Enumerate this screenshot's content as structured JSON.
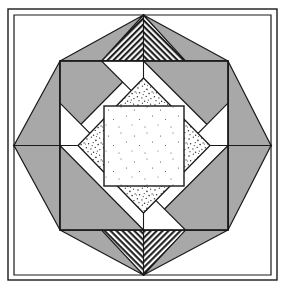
{
  "figure": {
    "kind": "geometric-quilt-block-diagram",
    "caption": "",
    "canvas": {
      "width": 288,
      "height": 293
    }
  },
  "colors": {
    "background": "#ffffff",
    "outline": "#1a1a1a",
    "solid_gray": "#a8a8a8",
    "hatch_line": "#222222",
    "hatch_background": "#ffffff",
    "stipple_dot": "#3a3a3a",
    "stipple_background": "#ffffff",
    "white_fill": "#ffffff"
  },
  "frame": {
    "name": "outer-border",
    "x": 8,
    "y": 9,
    "width": 269,
    "height": 271,
    "stroke_width": 1.4,
    "fill": "#ffffff"
  },
  "geometry": {
    "center": {
      "x": 143.5,
      "y": 145.5
    },
    "outer_square": {
      "left": 14,
      "top": 15,
      "right": 271,
      "bottom": 275
    },
    "hatched_ring_outer_diamond": [
      {
        "x": 143.5,
        "y": 15
      },
      {
        "x": 271,
        "y": 145.5
      },
      {
        "x": 143.5,
        "y": 275
      },
      {
        "x": 14,
        "y": 145.5
      }
    ],
    "hatched_ring_inner_diamond": [
      {
        "x": 143.5,
        "y": 60
      },
      {
        "x": 228,
        "y": 145.5
      },
      {
        "x": 143.5,
        "y": 231
      },
      {
        "x": 60,
        "y": 145.5
      }
    ],
    "middle_white_square": {
      "left": 60,
      "top": 61,
      "right": 228,
      "bottom": 230
    },
    "stipple_diamond": [
      {
        "x": 143.5,
        "y": 78
      },
      {
        "x": 210,
        "y": 145.5
      },
      {
        "x": 143.5,
        "y": 213
      },
      {
        "x": 78,
        "y": 145.5
      }
    ],
    "center_white_square": {
      "left": 104,
      "top": 106,
      "right": 184,
      "bottom": 186
    }
  },
  "shapes": {
    "outer_corner_triangles": [
      {
        "name": "corner-triangle-top-left",
        "points": "14,15 143.5,15 14,145.5",
        "fill": "white"
      },
      {
        "name": "corner-triangle-top-right",
        "points": "143.5,15 271,15 271,145.5",
        "fill": "white"
      },
      {
        "name": "corner-triangle-bottom-left",
        "points": "14,145.5 14,275 143.5,275",
        "fill": "white"
      },
      {
        "name": "corner-triangle-bottom-right",
        "points": "271,145.5 271,275 143.5,275",
        "fill": "white"
      }
    ],
    "hatched_band_segments": [
      {
        "name": "hatch-band-top-left",
        "points": "143.5,15 143.5,60 60,145.5 14,145.5"
      },
      {
        "name": "hatch-band-top-right",
        "points": "143.5,15 271,145.5 228,145.5 143.5,60"
      },
      {
        "name": "hatch-band-bottom-right",
        "points": "271,145.5 143.5,275 143.5,231 228,145.5"
      },
      {
        "name": "hatch-band-bottom-left",
        "points": "14,145.5 60,145.5 143.5,231 143.5,275"
      }
    ],
    "gray_outer_corner_triangles": [
      {
        "name": "gray-triangle-outer-top-left",
        "points": "60,61 143.5,61 102,103"
      },
      {
        "name": "gray-triangle-outer-top-right",
        "points": "143.5,61 228,61 186,103"
      },
      {
        "name": "gray-triangle-outer-bottom-left",
        "points": "60,230 143.5,230 102,188"
      },
      {
        "name": "gray-triangle-outer-bottom-right",
        "points": "143.5,230 228,230 186,188"
      }
    ],
    "gray_flag_triangles": [
      {
        "name": "gray-flag-top-left",
        "points": "60,61 60,145.5 143.5,61"
      },
      {
        "name": "gray-flag-top-right",
        "points": "228,61 228,145.5 143.5,61"
      },
      {
        "name": "gray-flag-bottom-left",
        "points": "60,230 60,145.5 143.5,230"
      },
      {
        "name": "gray-flag-bottom-right",
        "points": "228,230 228,145.5 143.5,230"
      }
    ],
    "gray_notch_squares": [
      {
        "name": "gray-notch-top-left",
        "points": "60,61 143.5,61 143.5,78 78,145.5 60,145.5"
      },
      {
        "name": "gray-notch-top-right",
        "points": "228,61 143.5,61 143.5,78 210,145.5 228,145.5"
      },
      {
        "name": "gray-notch-bottom-left",
        "points": "60,230 143.5,230 143.5,213 78,145.5 60,145.5"
      },
      {
        "name": "gray-notch-bottom-right",
        "points": "228,230 143.5,230 143.5,213 210,145.5 228,145.5"
      }
    ],
    "white_inner_triangles": [
      {
        "name": "white-wedge-top-left",
        "points": "60,61 143.5,61 60,145.5"
      },
      {
        "name": "white-wedge-top-right",
        "points": "228,61 143.5,61 228,145.5"
      },
      {
        "name": "white-wedge-bottom-left",
        "points": "60,230 143.5,230 60,145.5"
      },
      {
        "name": "white-wedge-bottom-right",
        "points": "228,230 143.5,230 228,145.5"
      }
    ]
  },
  "patterns": {
    "diagonal_hatch": {
      "name": "diagonal-hatch",
      "spacing_px": 3,
      "line_width_px": 1.5,
      "directions": {
        "top_band": "slash-forward",
        "left_band": "slash-forward",
        "right_band": "slash-back",
        "bottom_band": "slash-back"
      }
    },
    "stipple": {
      "name": "stipple-dots",
      "density": "medium",
      "dot_radius_px": 0.7
    }
  },
  "labels": {
    "figure_label": "",
    "annotations": []
  }
}
